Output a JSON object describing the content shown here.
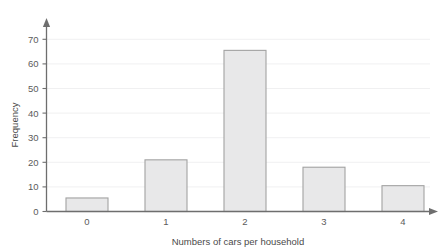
{
  "chart_data": {
    "type": "bar",
    "title": "",
    "subtitle": "",
    "xlabel": "Numbers of cars per household",
    "ylabel": "Frequency",
    "categories": [
      "0",
      "1",
      "2",
      "3",
      "4"
    ],
    "values": [
      5.5,
      21,
      65.5,
      18,
      10.5
    ],
    "series": [
      {
        "name": "Frequency",
        "values": [
          5.5,
          21,
          65.5,
          18,
          10.5
        ]
      }
    ],
    "ylim": [
      0,
      73
    ],
    "y_ticks": [
      0,
      10,
      20,
      30,
      40,
      50,
      60,
      70
    ],
    "y_tick_labels": [
      "0",
      "10",
      "20",
      "30",
      "40",
      "50",
      "60",
      "70"
    ],
    "x_tick_labels": [
      "0",
      "1",
      "2",
      "3",
      "4"
    ],
    "grid": true,
    "grid_axis": "y",
    "legend": false,
    "legend_position": "none",
    "annotations": [],
    "colors": {
      "bar_fill": "#e8e8e9",
      "bar_stroke": "#a2a2a2",
      "axis": "#6e6e6e",
      "gridline": "#ececed",
      "text": "#5b5b5b",
      "background": "#ffffff"
    },
    "axis_style": {
      "y_axis_arrow": true,
      "x_axis_arrow": true
    }
  }
}
